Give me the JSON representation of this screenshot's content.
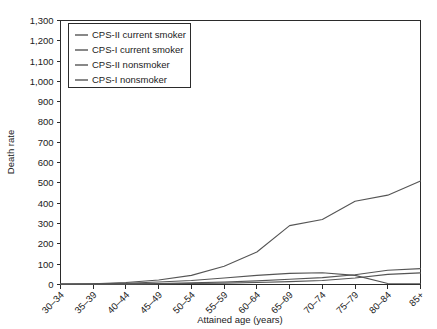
{
  "chart_data": {
    "type": "line",
    "title": "",
    "xlabel": "Attained age (years)",
    "ylabel": "Death rate",
    "categories": [
      "30–34",
      "35–39",
      "40–44",
      "45–49",
      "50–54",
      "55–59",
      "60–64",
      "65–69",
      "70–74",
      "75–79",
      "80–84",
      "85+"
    ],
    "ylim": [
      0,
      1300
    ],
    "ytick_values": [
      0,
      100,
      200,
      300,
      400,
      500,
      600,
      700,
      800,
      900,
      1000,
      1100,
      1200,
      1300
    ],
    "ytick_labels": [
      "0",
      "100",
      "200",
      "300",
      "400",
      "500",
      "600",
      "700",
      "800",
      "900",
      "1,000",
      "1,100",
      "1,200",
      "1,300"
    ],
    "grid": false,
    "legend_position": "upper-left",
    "series": [
      {
        "name": "CPS-II current smoker",
        "color": "#555555",
        "values": [
          2,
          4,
          10,
          22,
          45,
          90,
          160,
          290,
          320,
          410,
          440,
          510
        ]
      },
      {
        "name": "CPS-I current smoker",
        "color": "#555555",
        "values": [
          2,
          3,
          6,
          12,
          20,
          32,
          45,
          55,
          58,
          45,
          5,
          4
        ]
      },
      {
        "name": "CPS-II nonsmoker",
        "color": "#555555",
        "values": [
          1,
          2,
          3,
          5,
          8,
          12,
          18,
          26,
          34,
          48,
          70,
          78
        ]
      },
      {
        "name": "CPS-I nonsmoker",
        "color": "#555555",
        "values": [
          1,
          1,
          2,
          3,
          5,
          7,
          10,
          14,
          20,
          32,
          50,
          57
        ]
      }
    ]
  },
  "legend": {
    "items": [
      {
        "label": "CPS-II current smoker"
      },
      {
        "label": "CPS-I current smoker"
      },
      {
        "label": "CPS-II nonsmoker"
      },
      {
        "label": "CPS-I nonsmoker"
      }
    ]
  }
}
